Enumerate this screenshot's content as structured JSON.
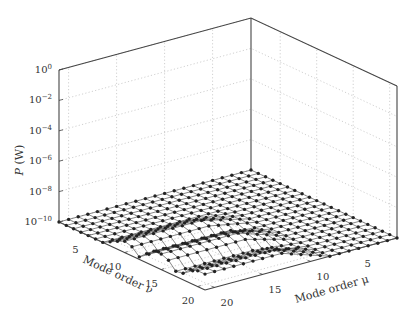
{
  "chart_data": {
    "type": "surface3d",
    "title": "",
    "zlabel": "P (W)",
    "xlabel": "Mode order ν",
    "ylabel": "Mode order μ",
    "z_scale": "log",
    "z_ticks": [
      "10^0",
      "10^-2",
      "10^-4",
      "10^-6",
      "10^-8",
      "10^-10"
    ],
    "z_tick_exponents": [
      0,
      -2,
      -4,
      -6,
      -8,
      -10
    ],
    "zlim_log10": [
      -10,
      0
    ],
    "nu_ticks": [
      5,
      10,
      15,
      20
    ],
    "mu_ticks": [
      5,
      10,
      15,
      20
    ],
    "nu_range": [
      1,
      21
    ],
    "mu_range": [
      1,
      21
    ],
    "grid": true,
    "grid_style": "dotted",
    "marker": "filled-circle",
    "baseline_log10": -10
  },
  "labels": {
    "z_axis": "P (W)",
    "nu_axis": "Mode order ν",
    "mu_axis": "Mode order μ"
  }
}
